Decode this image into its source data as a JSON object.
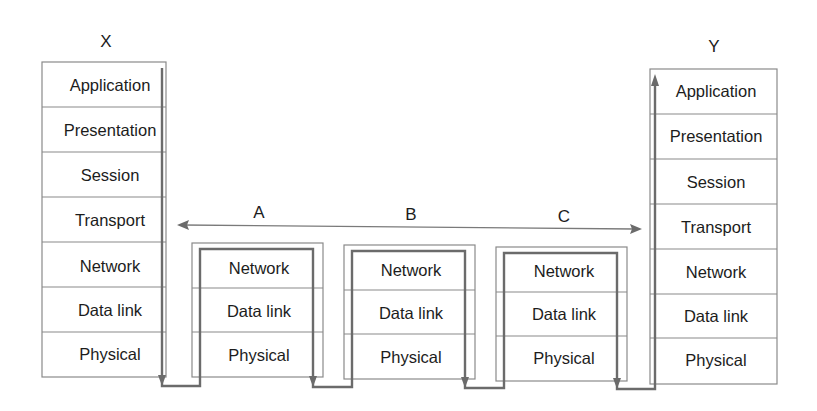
{
  "diagram": {
    "type": "OSI layered communication path through intermediate nodes",
    "hosts": {
      "X": {
        "label": "X",
        "layers": [
          "Application",
          "Presentation",
          "Session",
          "Transport",
          "Network",
          "Data link",
          "Physical"
        ]
      },
      "Y": {
        "label": "Y",
        "layers": [
          "Application",
          "Presentation",
          "Session",
          "Transport",
          "Network",
          "Data link",
          "Physical"
        ]
      }
    },
    "intermediate_nodes": [
      {
        "label": "A",
        "layers": [
          "Network",
          "Data link",
          "Physical"
        ]
      },
      {
        "label": "B",
        "layers": [
          "Network",
          "Data link",
          "Physical"
        ]
      },
      {
        "label": "C",
        "layers": [
          "Network",
          "Data link",
          "Physical"
        ]
      }
    ],
    "connections": [
      {
        "from": "X.Transport",
        "to": "Y.Transport",
        "style": "double-headed arrow",
        "spans": [
          "A",
          "B",
          "C"
        ]
      },
      {
        "from": "X.Application",
        "to": "Y.Application",
        "style": "data path down X, through A, B, C (up to Network and back down), up Y"
      }
    ],
    "colors": {
      "box_stroke": "#8a8a8a",
      "path_stroke": "#6b6b6b",
      "text": "#1c1c1c",
      "background": "#ffffff"
    }
  }
}
